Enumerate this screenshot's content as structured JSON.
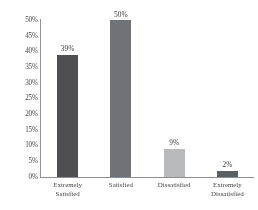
{
  "chart_data": {
    "type": "bar",
    "title": "",
    "subtitle": "",
    "xlabel": "",
    "ylabel": "",
    "categories": [
      "Extremely Satisfied",
      "Satisfied",
      "Dissatisfied",
      "Extremely Dissatisfied"
    ],
    "category_lines": [
      [
        "Extremely",
        "Satisfied"
      ],
      [
        "Satisfied"
      ],
      [
        "Dissatisfied"
      ],
      [
        "Extremely",
        "Dissatisfied"
      ]
    ],
    "values": [
      39,
      50,
      9,
      2
    ],
    "data_labels": [
      "39%",
      "50%",
      "9%",
      "2%"
    ],
    "ylim": [
      0,
      50
    ],
    "ytick_values": [
      0,
      5,
      10,
      15,
      20,
      25,
      30,
      35,
      40,
      45,
      50
    ],
    "ytick_labels": [
      "0%",
      "5%",
      "10%",
      "15%",
      "20%",
      "25%",
      "30%",
      "35%",
      "40%",
      "45%",
      "50%"
    ],
    "grid": false,
    "legend": false,
    "legend_position": "none",
    "bar_colors": [
      "#4d4d52",
      "#6f7276",
      "#b9bbbd",
      "#5a5d62"
    ],
    "axis_color": "#8b8e92",
    "text_color": "#45454a",
    "background": "#ffffff"
  }
}
